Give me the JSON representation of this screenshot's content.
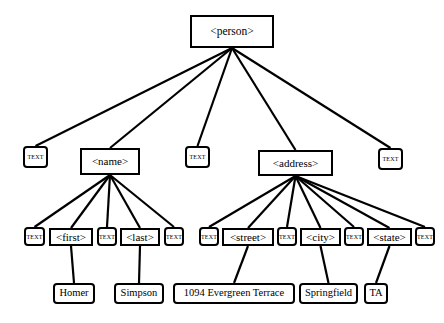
{
  "diagram": {
    "type": "tree",
    "background_color": "#ffffff",
    "node_border_color": "#000000",
    "edge_color": "#000000",
    "text_node_label": "TEXT",
    "nodes": [
      {
        "id": "person",
        "label": "<person>",
        "kind": "element",
        "x": 190,
        "y": 15,
        "w": 84,
        "h": 33
      },
      {
        "id": "t1",
        "label": "TEXT",
        "kind": "textnode",
        "x": 23,
        "y": 146,
        "w": 25,
        "h": 22
      },
      {
        "id": "name",
        "label": "<name>",
        "kind": "element",
        "x": 80,
        "y": 148,
        "w": 60,
        "h": 27
      },
      {
        "id": "t2",
        "label": "TEXT",
        "kind": "textnode",
        "x": 185,
        "y": 146,
        "w": 25,
        "h": 22
      },
      {
        "id": "address",
        "label": "<address>",
        "kind": "element",
        "x": 258,
        "y": 150,
        "w": 75,
        "h": 26
      },
      {
        "id": "t3",
        "label": "TEXT",
        "kind": "textnode",
        "x": 378,
        "y": 148,
        "w": 25,
        "h": 22
      },
      {
        "id": "t4",
        "label": "TEXT",
        "kind": "textnode",
        "x": 24,
        "y": 227,
        "w": 21,
        "h": 19
      },
      {
        "id": "first",
        "label": "<first>",
        "kind": "element",
        "x": 49,
        "y": 228,
        "w": 44,
        "h": 18
      },
      {
        "id": "t5",
        "label": "TEXT",
        "kind": "textnode",
        "x": 97,
        "y": 227,
        "w": 20,
        "h": 19
      },
      {
        "id": "last",
        "label": "<last>",
        "kind": "element",
        "x": 120,
        "y": 228,
        "w": 40,
        "h": 18
      },
      {
        "id": "t6",
        "label": "TEXT",
        "kind": "textnode",
        "x": 164,
        "y": 227,
        "w": 20,
        "h": 19
      },
      {
        "id": "t7",
        "label": "TEXT",
        "kind": "textnode",
        "x": 199,
        "y": 227,
        "w": 20,
        "h": 19
      },
      {
        "id": "street",
        "label": "<street>",
        "kind": "element",
        "x": 222,
        "y": 228,
        "w": 52,
        "h": 18
      },
      {
        "id": "t8",
        "label": "TEXT",
        "kind": "textnode",
        "x": 277,
        "y": 227,
        "w": 20,
        "h": 19
      },
      {
        "id": "city",
        "label": "<city>",
        "kind": "element",
        "x": 300,
        "y": 228,
        "w": 41,
        "h": 18
      },
      {
        "id": "t9",
        "label": "TEXT",
        "kind": "textnode",
        "x": 344,
        "y": 227,
        "w": 20,
        "h": 19
      },
      {
        "id": "state",
        "label": "<state>",
        "kind": "element",
        "x": 367,
        "y": 228,
        "w": 45,
        "h": 18
      },
      {
        "id": "t10",
        "label": "TEXT",
        "kind": "textnode",
        "x": 415,
        "y": 227,
        "w": 20,
        "h": 19
      },
      {
        "id": "homer",
        "label": "Homer",
        "kind": "value",
        "x": 53,
        "y": 283,
        "w": 42,
        "h": 21
      },
      {
        "id": "simpson",
        "label": "Simpson",
        "kind": "value",
        "x": 114,
        "y": 283,
        "w": 50,
        "h": 21
      },
      {
        "id": "terrace",
        "label": "1094 Evergreen Terrace",
        "kind": "value",
        "x": 173,
        "y": 283,
        "w": 122,
        "h": 21
      },
      {
        "id": "sfield",
        "label": "Springfield",
        "kind": "value",
        "x": 299,
        "y": 283,
        "w": 59,
        "h": 21
      },
      {
        "id": "ta",
        "label": "TA",
        "kind": "value",
        "x": 364,
        "y": 283,
        "w": 24,
        "h": 21
      }
    ],
    "edges": [
      {
        "from": "person",
        "to": "t1"
      },
      {
        "from": "person",
        "to": "name"
      },
      {
        "from": "person",
        "to": "t2"
      },
      {
        "from": "person",
        "to": "address"
      },
      {
        "from": "person",
        "to": "t3"
      },
      {
        "from": "name",
        "to": "t4"
      },
      {
        "from": "name",
        "to": "first"
      },
      {
        "from": "name",
        "to": "t5"
      },
      {
        "from": "name",
        "to": "last"
      },
      {
        "from": "name",
        "to": "t6"
      },
      {
        "from": "address",
        "to": "t7"
      },
      {
        "from": "address",
        "to": "street"
      },
      {
        "from": "address",
        "to": "t8"
      },
      {
        "from": "address",
        "to": "city"
      },
      {
        "from": "address",
        "to": "t9"
      },
      {
        "from": "address",
        "to": "state"
      },
      {
        "from": "address",
        "to": "t10"
      },
      {
        "from": "first",
        "to": "homer"
      },
      {
        "from": "last",
        "to": "simpson"
      },
      {
        "from": "street",
        "to": "terrace"
      },
      {
        "from": "city",
        "to": "sfield"
      },
      {
        "from": "state",
        "to": "ta"
      }
    ]
  }
}
